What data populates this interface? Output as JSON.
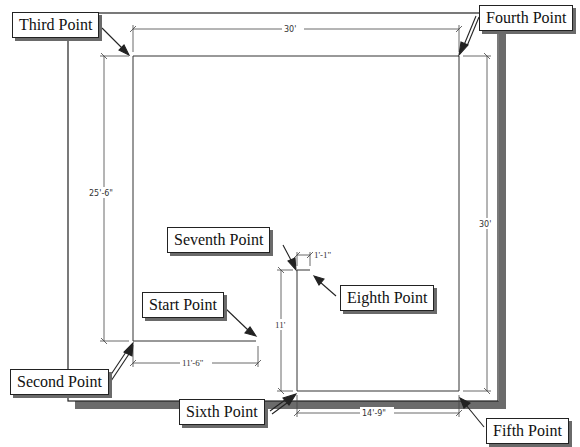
{
  "diagram": {
    "type": "floor-plan-dimension-drawing",
    "callouts": {
      "start": "Start Point",
      "second": "Second Point",
      "third": "Third Point",
      "fourth": "Fourth Point",
      "fifth": "Fifth Point",
      "sixth": "Sixth Point",
      "seventh": "Seventh Point",
      "eighth": "Eighth Point"
    },
    "dimensions": {
      "top_width": "30'",
      "left_height": "25'-6\"",
      "right_height": "30'",
      "bottom_left_width": "11'-6\"",
      "bottom_right_width": "14'-9\"",
      "notch_height": "11'",
      "notch_width": "1'-1\""
    },
    "colors": {
      "line": "#222222",
      "dim_line": "#444444",
      "shadow": "#6a6a6a",
      "background": "#ffffff"
    }
  }
}
